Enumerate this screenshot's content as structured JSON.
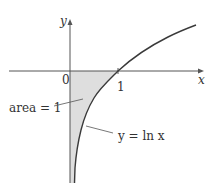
{
  "figure": {
    "type": "function-graph",
    "function": "y = ln x",
    "axes": {
      "x_label": "x",
      "y_label": "y",
      "origin_label": "0",
      "x_tick_label": "1"
    },
    "curve_label": "y = ln x",
    "area_label": "area = 1",
    "colors": {
      "axis": "#555555",
      "curve": "#3a3a3a",
      "shade": "#dedede",
      "text": "#333333"
    }
  }
}
